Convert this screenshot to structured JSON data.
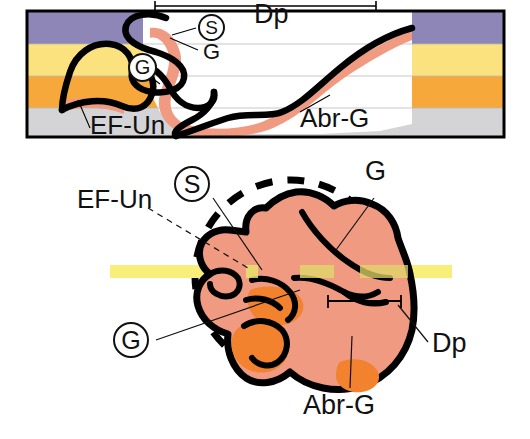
{
  "figure": {
    "title_visible": false,
    "panels": [
      "cross-section-panel",
      "clast-detail-panel"
    ]
  },
  "colors": {
    "layer_purple": "#8d86b6",
    "layer_yellow": "#fbe27e",
    "layer_orange": "#f7a83a",
    "layer_gray": "#d4d4d6",
    "clast_fill": "#f09a82",
    "clast_abrasion": "#f2822e",
    "outline_black": "#000000",
    "band_yellow": "#f7ef7a",
    "leader_line": "#111111",
    "frame_black": "#000000",
    "background_white": "#ffffff"
  },
  "upper_panel": {
    "name": "stratigraphic-cross-section",
    "frame": {
      "x": 26,
      "y": 10,
      "width": 479,
      "height": 128
    },
    "layers": [
      {
        "name": "purple-unit",
        "color": "#8d86b6",
        "top": 10,
        "bottom": 44
      },
      {
        "name": "yellow-unit",
        "color": "#fbe27e",
        "top": 44,
        "bottom": 76
      },
      {
        "name": "orange-unit",
        "color": "#f7a83a",
        "top": 76,
        "bottom": 108
      },
      {
        "name": "gray-unit",
        "color": "#d4d4d6",
        "top": 108,
        "bottom": 138
      }
    ],
    "incision_fill": "#ffffff",
    "scale_bar": {
      "label": "Dp",
      "x1": 155,
      "x2": 376,
      "y": 6
    },
    "labels": {
      "dp": "Dp",
      "s_circled": "S",
      "g_plain": "G",
      "g_circled": "G",
      "ef_un": "EF-Un",
      "abr_g": "Abr-G"
    }
  },
  "lower_panel": {
    "name": "clast-detail-view",
    "dashed_circle": {
      "cx": 291,
      "cy": 276,
      "r": 96
    },
    "yellow_band": {
      "x1": 110,
      "x2": 452,
      "y": 265,
      "height": 13
    },
    "scale_bar": {
      "label": "Dp",
      "x1": 328,
      "x2": 401,
      "y": 301
    },
    "labels": {
      "ef_un": "EF-Un",
      "s_circled": "S",
      "g_circled": "G",
      "g_plain": "G",
      "dp": "Dp",
      "abr_g": "Abr-G"
    }
  },
  "legend_terms": {
    "Dp": "Dp",
    "S": "S",
    "G": "G",
    "EF-Un": "EF-Un",
    "Abr-G": "Abr-G"
  }
}
